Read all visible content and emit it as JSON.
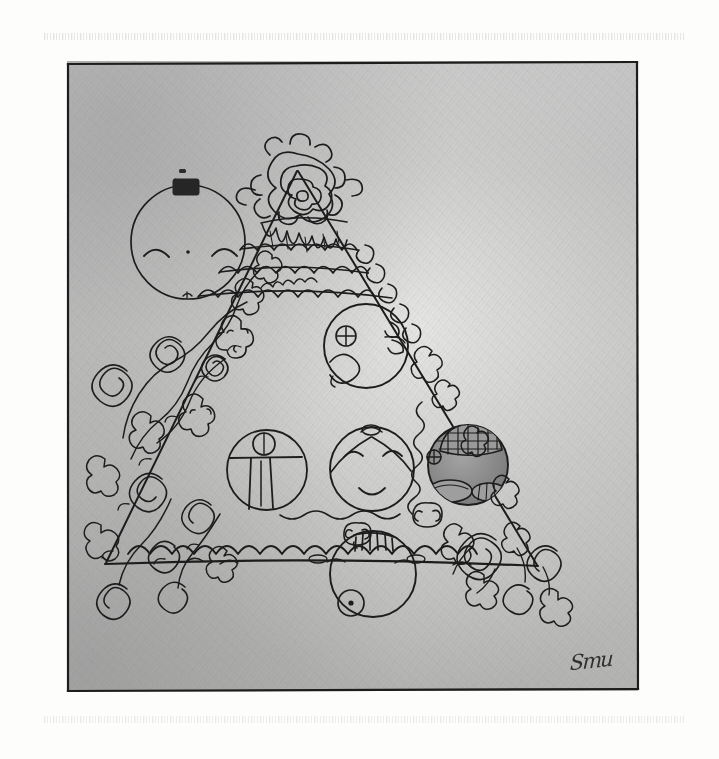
{
  "document": {
    "medium": "pencil and ink drawing on paper (scanned)",
    "title": "Triangular tiered cake with faces",
    "paper_color": "#fdfdfc",
    "ink_color": "#1d1d1d",
    "background_shading": "graphite gray pencil hatching",
    "canvas": {
      "width": 719,
      "height": 759
    }
  },
  "frame": {
    "label": "hand-ruled rectangular border",
    "x": 65,
    "y": 59,
    "width": 575,
    "height": 634,
    "stroke": "#1d1d1d",
    "stroke_width": 2.2
  },
  "scan_artifacts": [
    {
      "name": "top-band",
      "y": 33,
      "note": "faint dotted scanner streak"
    },
    {
      "name": "bottom-band",
      "y": 716,
      "note": "faint dotted scanner streak"
    }
  ],
  "shading": {
    "top_tone": "#c9c9c9",
    "mid_tone": "#b4b4b4",
    "light_tone": "#e3e3e1",
    "corner_tone": "#a8a8a8",
    "note": "graphite wash darkest at upper-left and lower-left, lightest near center-right"
  },
  "subject": {
    "name": "triangular tiered cake",
    "apex": {
      "x": 297,
      "y": 170
    },
    "base_left": {
      "x": 105,
      "y": 563
    },
    "base_right": {
      "x": 537,
      "y": 565
    },
    "description": "a tall triangle read as a decorated cake, crowned by a rose cluster, banded with scalloped icing, studded with round face medallions and trailing floral vines"
  },
  "elements": {
    "crown_rose": {
      "name": "rose-cluster-topper",
      "cx": 298,
      "cy": 180,
      "description": "dense scribbled rose bloom with petals and leaves at the summit"
    },
    "drip_band": {
      "name": "icing-drip-band",
      "y": 215,
      "description": "melting icing drips hanging below the topper"
    },
    "scallop_bands": [
      {
        "name": "scallop-band-upper",
        "y": 243,
        "width": 120
      },
      {
        "name": "scallop-band-middle",
        "y": 268,
        "width": 175
      },
      {
        "name": "scallop-band-lower",
        "y": 290,
        "width": 215
      },
      {
        "name": "scallop-band-base",
        "y": 552,
        "width": 420
      }
    ],
    "medallions": [
      {
        "name": "moon-face-medallion",
        "label": "floating face outside the cake",
        "cx": 188,
        "cy": 242,
        "r": 57,
        "fill": "none",
        "features": "two closed curved eyes, dot nose, tiny mouth, solid dark rectangle tab at the top of the rim",
        "position": "upper-left, detached from the triangle"
      },
      {
        "name": "top-face-medallion",
        "label": "face with swirl eye",
        "cx": 366,
        "cy": 346,
        "r": 42,
        "fill": "none",
        "features": "circled-cross eye at left, scalloped crescent at right rim, large hooked curve suggesting a cheek or jaw",
        "position": "upper tier of the cake"
      },
      {
        "name": "figure-medallion",
        "label": "standing figure medallion",
        "cx": 267,
        "cy": 470,
        "r": 40,
        "fill": "none",
        "features": "small circle head on a horizontal shoulder line with two long vertical legs below",
        "position": "middle tier, left"
      },
      {
        "name": "smiling-face-medallion",
        "label": "smiling face with topknot",
        "cx": 372,
        "cy": 469,
        "r": 42,
        "fill": "none",
        "features": "two closed arc eyes, gentle smile, center-parted hair and a small knot on the crown",
        "position": "middle tier, center"
      },
      {
        "name": "shaded-grid-medallion",
        "label": "dark crosshatched medallion",
        "cx": 468,
        "cy": 465,
        "r": 40,
        "fill": "#8f8f8f",
        "features": "crosshatched grid dome across the top, two hatched oval shapes at the bottom, small circled-cross at left rim; the darkest circle in the drawing",
        "position": "middle tier, right"
      },
      {
        "name": "ticked-medallion",
        "label": "medallion with tally marks",
        "cx": 373,
        "cy": 574,
        "r": 43,
        "fill": "none",
        "features": "short vertical tally strokes at the top rim and a small dotted circle at the lower left",
        "position": "bottom tier, center"
      }
    ],
    "left_vine": {
      "name": "left-floral-cascade",
      "description": "dense cascade of spiral roses, buds and clustered blossoms tumbling down the left slope and pooling in the lower-left corner",
      "rose_count": 14
    },
    "right_vine": {
      "name": "right-floral-trail",
      "description": "coiled spiral ribbon down the right slope with knotted blossoms, opening into a squiggling wave and rosettes in the lower-right",
      "rose_count": 9
    }
  },
  "signature": {
    "name": "artist-signature",
    "text": "Smu",
    "note": "illegible cursive initials, lower-right inside the frame"
  }
}
